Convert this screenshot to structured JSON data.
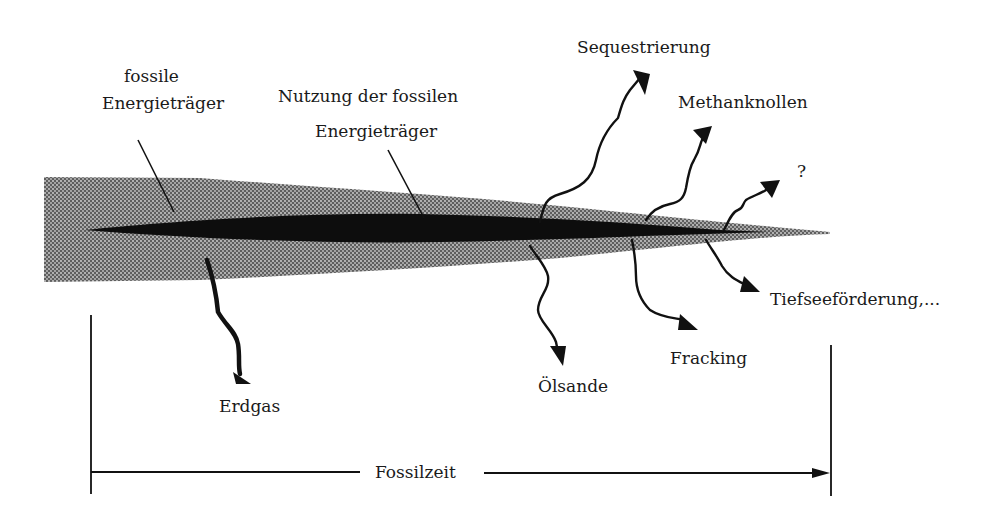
{
  "diagram": {
    "colors": {
      "band_fill": "#8a8a8a",
      "core_fill": "#0d0d0d",
      "ink": "#111111",
      "background": "#ffffff"
    },
    "labels": {
      "fossil_line1": "fossile",
      "fossil_line2": "Energieträger",
      "usage_line1": "Nutzung der fossilen",
      "usage_line2": "Energieträger",
      "sequestration": "Sequestrierung",
      "methane_hydrates": "Methanknollen",
      "unknown": "?",
      "deep_sea": "Tiefseeförderung,...",
      "fracking": "Fracking",
      "oil_sands": "Ölsande",
      "natural_gas": "Erdgas",
      "timeline": "Fossilzeit"
    },
    "branches": [
      {
        "name": "sequestration",
        "direction": "up"
      },
      {
        "name": "methane_hydrates",
        "direction": "up"
      },
      {
        "name": "unknown",
        "direction": "up"
      },
      {
        "name": "deep_sea",
        "direction": "down"
      },
      {
        "name": "fracking",
        "direction": "down"
      },
      {
        "name": "oil_sands",
        "direction": "down"
      },
      {
        "name": "natural_gas",
        "direction": "down"
      }
    ]
  }
}
